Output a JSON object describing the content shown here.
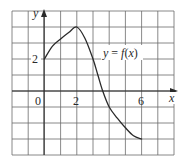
{
  "chart_data": {
    "type": "line",
    "title": "",
    "xlabel": "x",
    "ylabel": "y",
    "xlim": [
      -2,
      8
    ],
    "ylim": [
      -4,
      5
    ],
    "grid": true,
    "grid_step": 1,
    "x_tick_labels": [
      {
        "value": 0,
        "label": "0"
      },
      {
        "value": 2,
        "label": "2"
      },
      {
        "value": 6,
        "label": "6"
      }
    ],
    "y_tick_labels": [
      {
        "value": 2,
        "label": "2"
      }
    ],
    "series": [
      {
        "name": "y = f(x)",
        "x": [
          0,
          0.5,
          1,
          1.5,
          2,
          2.5,
          3,
          3.3,
          3.6,
          4,
          4.5,
          5,
          5.5,
          6
        ],
        "values": [
          2,
          2.8,
          3.25,
          3.65,
          4,
          3.3,
          2,
          1,
          0,
          -1,
          -1.7,
          -2.3,
          -2.8,
          -3
        ]
      }
    ],
    "annotations": [
      {
        "text": "y = f(x)",
        "x": 3.6,
        "y": 2.3
      }
    ]
  },
  "labels": {
    "y_axis": "y",
    "x_axis": "x",
    "origin": "0",
    "x_tick_2": "2",
    "x_tick_6": "6",
    "y_tick_2": "2",
    "curve_label_y": "y",
    "curve_label_eq": " = ",
    "curve_label_f": "f",
    "curve_label_paren_open": "(",
    "curve_label_x": "x",
    "curve_label_paren_close": ")"
  },
  "colors": {
    "grid": "#6b6b6b",
    "axis": "#2a2a2a",
    "curve": "#2a2a2a",
    "background": "#ffffff"
  }
}
